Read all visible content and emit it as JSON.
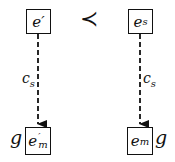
{
  "diagram": {
    "top_left_node": {
      "base": "e",
      "mark": "′",
      "sub": ""
    },
    "top_right_node": {
      "base": "e",
      "mark": "",
      "sub": "s"
    },
    "bottom_left_node": {
      "base": "e",
      "mark": "′",
      "sub": "m"
    },
    "bottom_right_node": {
      "base": "e",
      "mark": "",
      "sub": "m"
    },
    "relation_symbol": "≺",
    "left_edge_label": {
      "base": "c",
      "sub": "s"
    },
    "right_edge_label": {
      "base": "c",
      "sub": "s"
    },
    "left_g_label": "g",
    "right_g_label": "g",
    "edge_style": "dashed-arrow",
    "stroke_color": "#111111"
  }
}
